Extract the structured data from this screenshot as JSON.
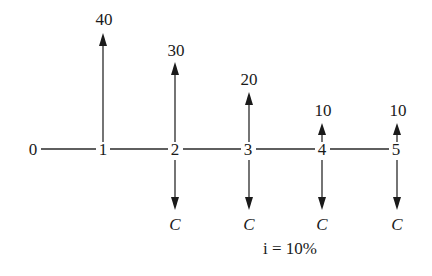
{
  "diagram": {
    "type": "cash-flow-diagram",
    "periods": [
      "0",
      "1",
      "2",
      "3",
      "4",
      "5"
    ],
    "inflows": [
      {
        "period": "1",
        "label": "40"
      },
      {
        "period": "2",
        "label": "30"
      },
      {
        "period": "3",
        "label": "20"
      },
      {
        "period": "4",
        "label": "10"
      },
      {
        "period": "5",
        "label": "10"
      }
    ],
    "outflows": [
      {
        "period": "2",
        "label": "C"
      },
      {
        "period": "3",
        "label": "C"
      },
      {
        "period": "4",
        "label": "C"
      },
      {
        "period": "5",
        "label": "C"
      }
    ],
    "interest_rate_label": "i = 10%"
  }
}
